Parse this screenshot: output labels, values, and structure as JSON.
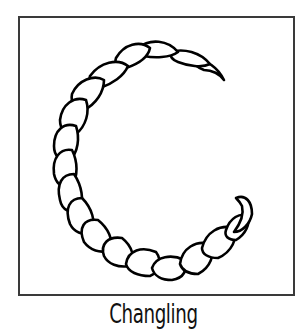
{
  "card": {
    "caption": "Changling",
    "border_color": "#3a3a3a",
    "background": "#ffffff",
    "illustration": {
      "subject": "braided-letter-C",
      "stroke_color": "#000000",
      "fill_color": "#ffffff"
    }
  }
}
